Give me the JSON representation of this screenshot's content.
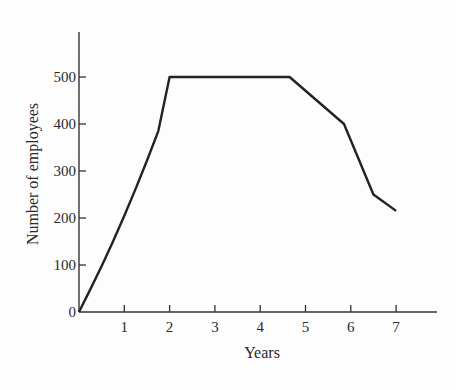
{
  "chart_data": {
    "type": "line",
    "title": "",
    "xlabel": "Years",
    "ylabel": "Number of employees",
    "xlim": [
      0,
      8
    ],
    "ylim": [
      0,
      600
    ],
    "grid": false,
    "legend": null,
    "x_ticks": [
      1,
      2,
      3,
      4,
      5,
      6,
      7
    ],
    "x_tick_labels": [
      "1",
      "2",
      "3",
      "4",
      "5",
      "6",
      "7"
    ],
    "y_ticks": [
      0,
      100,
      200,
      300,
      400,
      500
    ],
    "y_tick_labels": [
      "0",
      "100",
      "200",
      "300",
      "400",
      "500"
    ],
    "series": [
      {
        "name": "Number of employees",
        "x": [
          0,
          0.25,
          0.5,
          0.75,
          1.0,
          1.25,
          1.5,
          1.75,
          2.0,
          4.65,
          5.85,
          6.5,
          7.0
        ],
        "y": [
          0,
          48,
          98,
          150,
          205,
          262,
          322,
          385,
          500,
          500,
          400,
          250,
          215
        ]
      }
    ],
    "line_color": "#222222"
  }
}
